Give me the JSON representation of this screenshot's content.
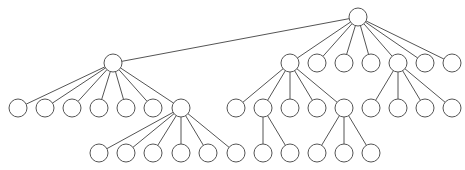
{
  "diagram": {
    "type": "tree",
    "node_radius": 9,
    "colors": {
      "stroke": "#555555",
      "fill": "#ffffff",
      "background": "#ffffff"
    },
    "nodes": [
      {
        "id": "root",
        "x": 358,
        "y": 17,
        "parent": null
      },
      {
        "id": "a",
        "x": 113,
        "y": 63,
        "parent": "root"
      },
      {
        "id": "b",
        "x": 290,
        "y": 63,
        "parent": "root"
      },
      {
        "id": "c",
        "x": 317,
        "y": 63,
        "parent": "root"
      },
      {
        "id": "d",
        "x": 344,
        "y": 63,
        "parent": "root"
      },
      {
        "id": "e",
        "x": 371,
        "y": 63,
        "parent": "root"
      },
      {
        "id": "f",
        "x": 398,
        "y": 63,
        "parent": "root"
      },
      {
        "id": "g",
        "x": 425,
        "y": 63,
        "parent": "root"
      },
      {
        "id": "h",
        "x": 452,
        "y": 63,
        "parent": "root"
      },
      {
        "id": "a1",
        "x": 18,
        "y": 108,
        "parent": "a"
      },
      {
        "id": "a2",
        "x": 45,
        "y": 108,
        "parent": "a"
      },
      {
        "id": "a3",
        "x": 72,
        "y": 108,
        "parent": "a"
      },
      {
        "id": "a4",
        "x": 99,
        "y": 108,
        "parent": "a"
      },
      {
        "id": "a5",
        "x": 126,
        "y": 108,
        "parent": "a"
      },
      {
        "id": "a6",
        "x": 153,
        "y": 108,
        "parent": "a"
      },
      {
        "id": "a7",
        "x": 181,
        "y": 108,
        "parent": "a"
      },
      {
        "id": "b1",
        "x": 236,
        "y": 108,
        "parent": "b"
      },
      {
        "id": "b2",
        "x": 263,
        "y": 108,
        "parent": "b"
      },
      {
        "id": "b3",
        "x": 290,
        "y": 108,
        "parent": "b"
      },
      {
        "id": "b4",
        "x": 317,
        "y": 108,
        "parent": "b"
      },
      {
        "id": "b5",
        "x": 344,
        "y": 108,
        "parent": "b"
      },
      {
        "id": "f1",
        "x": 371,
        "y": 108,
        "parent": "f"
      },
      {
        "id": "f2",
        "x": 398,
        "y": 108,
        "parent": "f"
      },
      {
        "id": "f3",
        "x": 425,
        "y": 108,
        "parent": "f"
      },
      {
        "id": "f4",
        "x": 452,
        "y": 108,
        "parent": "f"
      },
      {
        "id": "a7a",
        "x": 99,
        "y": 153,
        "parent": "a7"
      },
      {
        "id": "a7b",
        "x": 126,
        "y": 153,
        "parent": "a7"
      },
      {
        "id": "a7c",
        "x": 153,
        "y": 153,
        "parent": "a7"
      },
      {
        "id": "a7d",
        "x": 181,
        "y": 153,
        "parent": "a7"
      },
      {
        "id": "a7e",
        "x": 208,
        "y": 153,
        "parent": "a7"
      },
      {
        "id": "a7f",
        "x": 236,
        "y": 153,
        "parent": "a7"
      },
      {
        "id": "b2a",
        "x": 263,
        "y": 153,
        "parent": "b2"
      },
      {
        "id": "b2b",
        "x": 290,
        "y": 153,
        "parent": "b2"
      },
      {
        "id": "b5a",
        "x": 317,
        "y": 153,
        "parent": "b5"
      },
      {
        "id": "b5b",
        "x": 344,
        "y": 153,
        "parent": "b5"
      },
      {
        "id": "b5c",
        "x": 371,
        "y": 153,
        "parent": "b5"
      }
    ]
  }
}
